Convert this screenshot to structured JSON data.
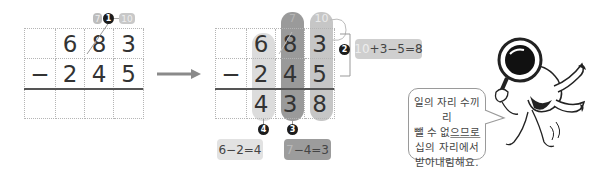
{
  "left_problem": {
    "top_row": [
      "",
      "6",
      "8",
      "3"
    ],
    "middle_row": [
      "−",
      "2",
      "4",
      "5"
    ],
    "bottom_row": [
      "",
      "",
      "",
      ""
    ],
    "borrow_note": {
      "crossed_to": "7",
      "borrowed": "10",
      "step": "1"
    }
  },
  "arrow": {
    "icon": "right-arrow-icon"
  },
  "right_problem": {
    "top_row": [
      "",
      "6",
      "8",
      "3"
    ],
    "middle_row": [
      "−",
      "2",
      "4",
      "5"
    ],
    "bottom_row": [
      "",
      "4",
      "3",
      "8"
    ],
    "top_annotations": {
      "hundreds_tens": "7",
      "ones": "10"
    }
  },
  "steps": {
    "step2": {
      "number": "2",
      "equation_prefix": "10",
      "equation_rest": "+3−5=8"
    },
    "step3": {
      "number": "3",
      "equation_prefix": "7",
      "equation_rest": "−4=3"
    },
    "step4": {
      "number": "4",
      "equation": "6−2=4"
    }
  },
  "speech_bubble": {
    "line1": "일의 자리 수끼리",
    "line2_a": "뺄 수 없",
    "line2_b": "으므로",
    "line3": "십의 자리에서",
    "line4": "받아내림해요."
  },
  "colors": {
    "light_pill": "#dcdcdc",
    "mid_pill": "#c6c6c6",
    "dark_pill": "#9a9a9a",
    "badge": "#1c1c1c"
  }
}
